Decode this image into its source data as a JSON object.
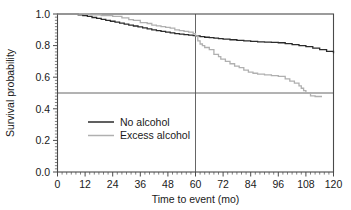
{
  "chart_data": {
    "type": "line",
    "title": "",
    "subtitle": "",
    "xlabel": "Time to event (mo)",
    "ylabel": "Survival probability",
    "xlim": [
      0,
      120
    ],
    "ylim": [
      0.0,
      1.0
    ],
    "xticks": [
      0,
      12,
      24,
      36,
      48,
      60,
      72,
      84,
      96,
      108,
      120
    ],
    "xtick_labels": [
      "0",
      "12",
      "24",
      "36",
      "48",
      "60",
      "72",
      "84",
      "96",
      "108",
      "120"
    ],
    "x_minor_tick_step": 2,
    "yticks": [
      0.0,
      0.2,
      0.4,
      0.6,
      0.8,
      1.0
    ],
    "ytick_labels": [
      "0.0",
      "0.2",
      "0.4",
      "0.6",
      "0.8",
      "1.0"
    ],
    "y_minor_tick_step": 0.02,
    "grid": false,
    "legend_position": "center-left",
    "step_type": "post",
    "reference_lines": [
      {
        "orientation": "vertical",
        "value": 60,
        "label": "60 months",
        "color": "#555555"
      },
      {
        "orientation": "horizontal",
        "value": 0.5,
        "label": "median survival 0.5",
        "color": "#555555"
      }
    ],
    "series": [
      {
        "name": "No alcohol",
        "color": "#2b2b2b",
        "line_width": 1.3,
        "x": [
          0,
          6,
          9,
          11,
          13,
          15,
          17,
          19,
          21,
          23,
          25,
          27,
          29,
          31,
          33,
          35,
          37,
          39,
          41,
          43,
          45,
          47,
          49,
          51,
          53,
          55,
          57,
          59,
          60,
          62,
          64,
          66,
          68,
          70,
          72,
          75,
          78,
          81,
          84,
          87,
          90,
          93,
          96,
          99,
          102,
          105,
          108,
          111,
          114,
          117,
          120
        ],
        "y": [
          1.0,
          1.0,
          0.995,
          0.99,
          0.985,
          0.978,
          0.972,
          0.966,
          0.96,
          0.954,
          0.948,
          0.942,
          0.936,
          0.93,
          0.924,
          0.918,
          0.912,
          0.906,
          0.9,
          0.895,
          0.89,
          0.885,
          0.88,
          0.876,
          0.872,
          0.869,
          0.866,
          0.863,
          0.861,
          0.857,
          0.853,
          0.85,
          0.847,
          0.844,
          0.841,
          0.837,
          0.833,
          0.83,
          0.827,
          0.824,
          0.822,
          0.82,
          0.818,
          0.812,
          0.806,
          0.8,
          0.793,
          0.784,
          0.775,
          0.764,
          0.752
        ]
      },
      {
        "name": "Excess alcohol",
        "color": "#b0b0b0",
        "line_width": 1.3,
        "x": [
          0,
          10,
          14,
          19,
          24,
          28,
          31,
          33,
          36,
          39,
          41,
          43,
          45,
          47,
          49,
          51,
          53,
          55,
          57,
          59,
          60,
          61,
          62,
          63,
          64,
          66,
          68,
          70,
          71,
          73,
          75,
          77,
          79,
          81,
          83,
          85,
          87,
          90,
          93,
          96,
          99,
          101,
          103,
          105,
          106,
          107,
          108,
          110,
          112,
          115
        ],
        "y": [
          1.0,
          1.0,
          0.995,
          0.99,
          0.985,
          0.975,
          0.965,
          0.96,
          0.945,
          0.94,
          0.93,
          0.925,
          0.92,
          0.915,
          0.91,
          0.9,
          0.895,
          0.89,
          0.885,
          0.875,
          0.862,
          0.83,
          0.81,
          0.8,
          0.788,
          0.775,
          0.745,
          0.73,
          0.715,
          0.7,
          0.685,
          0.67,
          0.66,
          0.645,
          0.632,
          0.625,
          0.62,
          0.615,
          0.61,
          0.605,
          0.59,
          0.575,
          0.562,
          0.545,
          0.53,
          0.515,
          0.5,
          0.482,
          0.478,
          0.478
        ]
      }
    ],
    "annotations": []
  },
  "legend": {
    "entries": [
      {
        "label": "No alcohol",
        "swatch": "line-swatch-dark"
      },
      {
        "label": "Excess alcohol",
        "swatch": "line-swatch-light"
      }
    ]
  },
  "colors": {
    "background": "#ffffff",
    "axis": "#4a4a4a",
    "text": "#1a1a1a",
    "series_no_alcohol": "#2b2b2b",
    "series_excess_alcohol": "#b0b0b0",
    "reference_line": "#555555"
  }
}
